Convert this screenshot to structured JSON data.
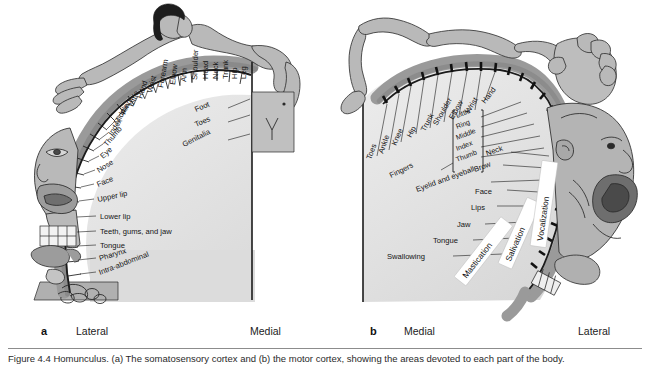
{
  "figure": {
    "panels": [
      {
        "letter": "a",
        "name": "sensory-homunculus",
        "orientation_left": "Lateral",
        "orientation_right": "Medial",
        "labels_arc": [
          "Intra-abdominal",
          "Pharynx",
          "Tongue",
          "Teeth, gums, and jaw",
          "Lower lip",
          "Upper lip",
          "Face",
          "Nose",
          "Eye",
          "Thumb",
          "Index",
          "Middle",
          "Ring",
          "Little",
          "Hand",
          "Wrist",
          "Forearm",
          "Elbow",
          "Arm",
          "Shoulder",
          "Head",
          "Neck",
          "Trunk",
          "Hip",
          "Leg",
          "Foot",
          "Toes",
          "Genitalia"
        ]
      },
      {
        "letter": "b",
        "name": "motor-homunculus",
        "orientation_left": "Medial",
        "orientation_right": "Lateral",
        "labels_arc": [
          "Toes",
          "Ankle",
          "Knee",
          "Hip",
          "Trunk",
          "Shoulder",
          "Elbow",
          "Wrist",
          "Hand",
          "Little",
          "Ring",
          "Middle",
          "Index",
          "Thumb",
          "Neck",
          "Brow",
          "Eyelid and eyeball",
          "Face",
          "Lips",
          "Jaw",
          "Tongue",
          "Swallowing"
        ],
        "bracket_label": "Fingers",
        "bracket_items": [
          "Little",
          "Ring",
          "Middle",
          "Index",
          "Thumb"
        ],
        "white_bands": [
          "Mastication",
          "Salivation",
          "Vocalization"
        ]
      }
    ],
    "caption": "Figure 4.4  Homunculus. (a) The somatosensory cortex and (b) the motor cortex, showing the areas devoted to each part of the body.",
    "colors": {
      "cortex_band": "#9a9a9a",
      "cortex_band_dark": "#7b7b7b",
      "interior": "#e4e4e4",
      "body_fill": "#b4b4b4",
      "body_fill_light": "#c6c6c6",
      "hair": "#1d1d1d",
      "outline": "#2a2a2a",
      "white_band": "#ffffff",
      "background": "#ffffff"
    }
  }
}
